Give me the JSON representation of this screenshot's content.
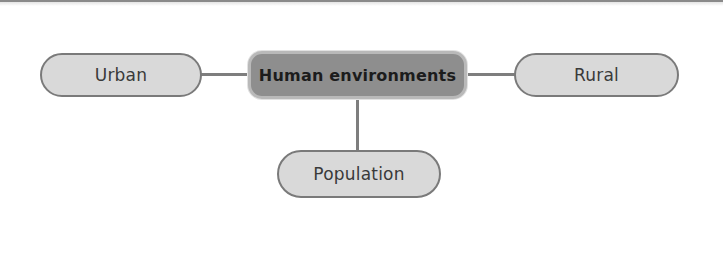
{
  "diagram": {
    "type": "mind-map",
    "central_node": {
      "label": "Human environments"
    },
    "branches": [
      {
        "id": "urban",
        "label": "Urban",
        "position": "left"
      },
      {
        "id": "rural",
        "label": "Rural",
        "position": "right"
      },
      {
        "id": "population",
        "label": "Population",
        "position": "bottom"
      }
    ],
    "colors": {
      "central_fill": "#8e8e8e",
      "central_border": "#b9b9b9",
      "branch_fill": "#d9d9d9",
      "branch_border": "#7a7a7a",
      "connector": "#7e7e7e"
    }
  }
}
